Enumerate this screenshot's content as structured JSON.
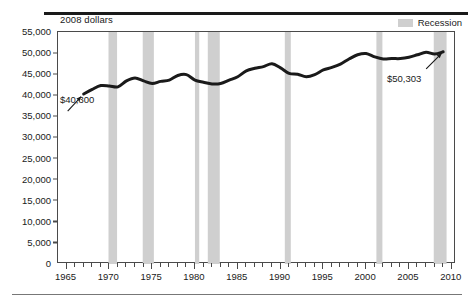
{
  "header": {
    "axis_note": "2008 dollars"
  },
  "legend": {
    "items": [
      {
        "label": "Recession",
        "color": "#cfcfcf",
        "icon": "recession-band-swatch"
      }
    ]
  },
  "annotations": {
    "start": {
      "label": "$40,300",
      "year": 1967,
      "value": 40300
    },
    "end": {
      "label": "$50,303",
      "year": 2009,
      "value": 50303
    }
  },
  "chart_data": {
    "type": "line",
    "title": "",
    "subtitle": "",
    "xlabel": "",
    "ylabel": "2008 dollars",
    "xlim": [
      1964,
      2010.5
    ],
    "ylim": [
      0,
      55000
    ],
    "grid": false,
    "legend_position": "top-right",
    "ytick_labels": [
      "0",
      "5,000",
      "10,000",
      "15,000",
      "20,000",
      "25,000",
      "30,000",
      "35,000",
      "40,000",
      "45,000",
      "50,000",
      "55,000"
    ],
    "ytick_values": [
      0,
      5000,
      10000,
      15000,
      20000,
      25000,
      30000,
      35000,
      40000,
      45000,
      50000,
      55000
    ],
    "xtick_labels": [
      "1965",
      "1970",
      "1975",
      "1980",
      "1985",
      "1990",
      "1995",
      "2000",
      "2005",
      "2010"
    ],
    "xtick_values": [
      1965,
      1970,
      1975,
      1980,
      1985,
      1990,
      1995,
      2000,
      2005,
      2010
    ],
    "xtick_minor_step": 1,
    "series": [
      {
        "name": "Median household income (2008 dollars)",
        "color": "#1a1a1a",
        "x": [
          1967,
          1968,
          1969,
          1970,
          1971,
          1972,
          1973,
          1974,
          1975,
          1976,
          1977,
          1978,
          1979,
          1980,
          1981,
          1982,
          1983,
          1984,
          1985,
          1986,
          1987,
          1988,
          1989,
          1990,
          1991,
          1992,
          1993,
          1994,
          1995,
          1996,
          1997,
          1998,
          1999,
          2000,
          2001,
          2002,
          2003,
          2004,
          2005,
          2006,
          2007,
          2008,
          2009
        ],
        "values": [
          40300,
          41400,
          42300,
          42200,
          42000,
          43400,
          44100,
          43400,
          42800,
          43300,
          43600,
          44700,
          44900,
          43600,
          43100,
          42700,
          42800,
          43600,
          44400,
          45800,
          46400,
          46800,
          47500,
          46500,
          45200,
          45000,
          44400,
          44900,
          46000,
          46600,
          47400,
          48600,
          49600,
          49900,
          49100,
          48600,
          48700,
          48700,
          49000,
          49600,
          50200,
          49800,
          50303
        ]
      }
    ],
    "recession_bands": [
      {
        "start": 1969.9,
        "end": 1970.9
      },
      {
        "start": 1973.9,
        "end": 1975.2
      },
      {
        "start": 1980.0,
        "end": 1980.5
      },
      {
        "start": 1981.5,
        "end": 1982.9
      },
      {
        "start": 1990.5,
        "end": 1991.2
      },
      {
        "start": 2001.2,
        "end": 2001.9
      },
      {
        "start": 2007.9,
        "end": 2009.4
      }
    ],
    "recession_band_color": "#cfcfcf"
  }
}
